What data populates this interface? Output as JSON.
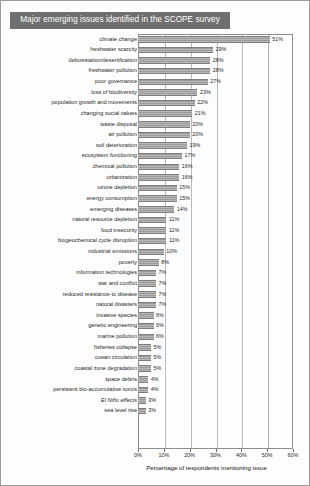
{
  "title": "Major emerging issues identified in the SCOPE survey",
  "chart_data": {
    "type": "bar",
    "orientation": "horizontal",
    "title": "Major emerging issues identified in the SCOPE survey",
    "xlabel": "Percentage of respondents mentioning issue",
    "ylabel": "",
    "xlim": [
      0,
      60
    ],
    "xticks": [
      0,
      10,
      20,
      30,
      40,
      50,
      60
    ],
    "xtick_labels": [
      "0%",
      "10%",
      "20%",
      "30%",
      "40%",
      "50%",
      "60%"
    ],
    "grid": true,
    "legend": false,
    "bar_color": "#9a9a9a",
    "value_label_suffix": "%",
    "categories": [
      "climate change",
      "freshwater scarcity",
      "deforestation/desertification",
      "freshwater pollution",
      "poor governance",
      "loss of biodiversity",
      "population growth and movements",
      "changing social values",
      "waste disposal",
      "air pollution",
      "soil deterioration",
      "ecosystem functioning",
      "chemical pollution",
      "urbanization",
      "ozone depletion",
      "energy consumption",
      "emerging diseases",
      "natural resource depletion",
      "food insecurity",
      "biogeochemical cycle disruption",
      "industrial emissions",
      "poverty",
      "information technologies",
      "war and conflict",
      "reduced resistance to disease",
      "natural disasters",
      "invasive species",
      "genetic engineering",
      "marine pollution",
      "fisheries collapse",
      "ocean circulation",
      "coastal zone degradation",
      "space debris",
      "persistent bio-accumulative toxics",
      "El Niño effects",
      "sea level rise"
    ],
    "values": [
      51,
      29,
      28,
      28,
      27,
      23,
      22,
      21,
      20,
      20,
      19,
      17,
      16,
      16,
      15,
      15,
      14,
      11,
      11,
      11,
      10,
      8,
      7,
      7,
      7,
      7,
      6,
      6,
      6,
      5,
      5,
      5,
      4,
      4,
      3,
      3
    ],
    "value_labels": [
      "51%",
      "29%",
      "28%",
      "28%",
      "27%",
      "23%",
      "22%",
      "21%",
      "20%",
      "20%",
      "19%",
      "17%",
      "16%",
      "16%",
      "15%",
      "15%",
      "14%",
      "11%",
      "11%",
      "11%",
      "10%",
      "8%",
      "7%",
      "7%",
      "7%",
      "7%",
      "6%",
      "6%",
      "6%",
      "5%",
      "5%",
      "5%",
      "4%",
      "4%",
      "3%",
      "3%"
    ],
    "italic_categories": [
      "El Niño effects"
    ]
  }
}
